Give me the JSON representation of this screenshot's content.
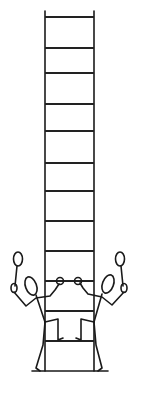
{
  "figure": {
    "stroke_color": "#1a1a1a",
    "background": "#ffffff",
    "ladder": {
      "rail_left_x": 45,
      "rail_right_x": 94,
      "top_y": 11,
      "bottom_y": 371,
      "rung_count": 12
    },
    "figures": [
      {
        "side": "left",
        "holds": "racket"
      },
      {
        "side": "right",
        "holds": "racket"
      }
    ]
  }
}
